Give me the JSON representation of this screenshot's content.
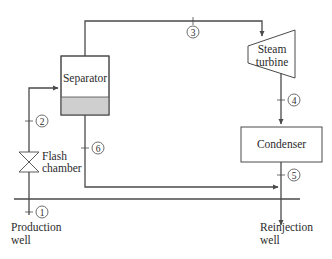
{
  "diagram": {
    "type": "flash steam geothermal power plant schematic",
    "components": {
      "separator": {
        "label": "Separator"
      },
      "turbine": {
        "label_line1": "Steam",
        "label_line2": "turbine"
      },
      "condenser": {
        "label": "Condenser"
      },
      "flash_chamber": {
        "label_line1": "Flash",
        "label_line2": "chamber"
      },
      "production_well": {
        "label_line1": "Production",
        "label_line2": "well"
      },
      "reinjection_well": {
        "label_line1": "Reinjection",
        "label_line2": "well"
      }
    },
    "states": [
      "1",
      "2",
      "3",
      "4",
      "5",
      "6"
    ],
    "colors": {
      "line": "#4a4a4a",
      "liquid_fill": "#cfcfcf",
      "background": "#ffffff"
    }
  }
}
